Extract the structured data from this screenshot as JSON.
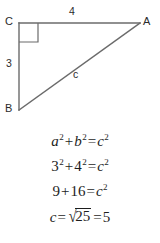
{
  "figure": {
    "vertices": [
      {
        "name": "C",
        "label": "C",
        "x": 19,
        "y": 23
      },
      {
        "name": "A",
        "label": "A",
        "x": 140,
        "y": 23
      },
      {
        "name": "B",
        "label": "B",
        "x": 19,
        "y": 110
      }
    ],
    "side_labels": {
      "top": "4",
      "left": "3",
      "hypotenuse": "c"
    },
    "right_angle_at": "C",
    "line_color": "#6b6b6b",
    "text_color": "#2b2b2b",
    "background_color": "#ffffff"
  },
  "equations": {
    "line1": {
      "lhs_var_a": "a",
      "exp_a": "2",
      "plus": "+",
      "lhs_var_b": "b",
      "exp_b": "2",
      "equals": "=",
      "rhs_var_c": "c",
      "exp_c": "2"
    },
    "line2": {
      "lhs_num_a": "3",
      "exp_a": "2",
      "plus": "+",
      "lhs_num_b": "4",
      "exp_b": "2",
      "equals": "=",
      "rhs_var_c": "c",
      "exp_c": "2"
    },
    "line3": {
      "lhs_num_a": "9",
      "plus": "+",
      "lhs_num_b": "16",
      "equals": "=",
      "rhs_var_c": "c",
      "exp_c": "2"
    },
    "line4": {
      "lhs_var_c": "c",
      "equals1": "=",
      "radical_sign": "√",
      "radicand": "25",
      "equals2": "=",
      "result": "5"
    }
  }
}
